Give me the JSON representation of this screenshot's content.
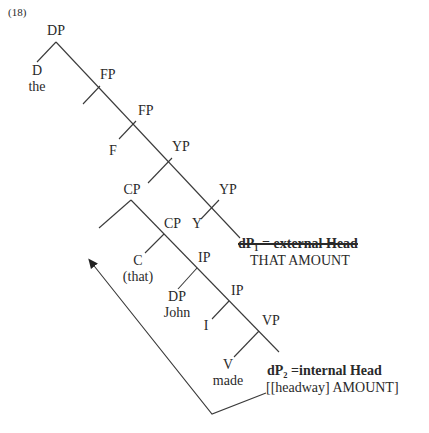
{
  "example_number": "(18)",
  "nodes": {
    "dp_root": "DP",
    "d": "D",
    "the": "the",
    "fp1": "FP",
    "fp2": "FP",
    "f": "F",
    "yp1": "YP",
    "cp1": "CP",
    "yp2": "YP",
    "y": "Y",
    "cp2": "CP",
    "c": "C",
    "that": "(that)",
    "ip1": "IP",
    "dp_john": "DP",
    "john": "John",
    "ip2": "IP",
    "i": "I",
    "vp": "VP",
    "v": "V",
    "made": "made"
  },
  "annotations": {
    "external_head_label": "dP₁ = external Head",
    "external_head_value": "THAT AMOUNT",
    "internal_head_label": "dP₂ =internal Head",
    "internal_head_value": "[[headway] AMOUNT]"
  },
  "colors": {
    "line": "#3a3a3a",
    "text": "#2a2a2a"
  }
}
